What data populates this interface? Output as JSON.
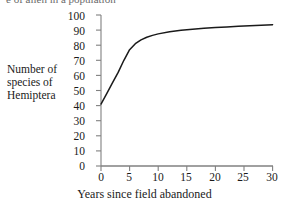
{
  "top_cut_text": "e of alien in a population",
  "chart_data": {
    "type": "line",
    "title": "",
    "xlabel": "Years since field abandoned",
    "ylabel": "Number of species of Hemiptera",
    "ylabel_lines": [
      "Number of",
      "species of",
      "Hemiptera"
    ],
    "xlim": [
      0,
      30
    ],
    "ylim": [
      0,
      100
    ],
    "xticks": [
      0,
      5,
      10,
      15,
      20,
      25,
      30
    ],
    "yticks": [
      0,
      10,
      20,
      30,
      40,
      50,
      60,
      70,
      80,
      90,
      100
    ],
    "grid": false,
    "legend": "none",
    "series": [
      {
        "name": "Hemiptera species richness",
        "color": "#1a1a1a",
        "x": [
          0,
          1,
          2,
          3,
          4,
          5,
          6,
          7,
          8,
          9,
          10,
          12,
          14,
          16,
          18,
          20,
          22,
          24,
          26,
          28,
          30
        ],
        "y": [
          41,
          48,
          55,
          62,
          70,
          77,
          81,
          83.5,
          85.3,
          86.5,
          87.5,
          88.9,
          89.9,
          90.6,
          91.2,
          91.7,
          92.1,
          92.5,
          92.9,
          93.2,
          93.6
        ]
      }
    ],
    "axis_color": "#808080",
    "curve_color": "#1a1a1a"
  }
}
